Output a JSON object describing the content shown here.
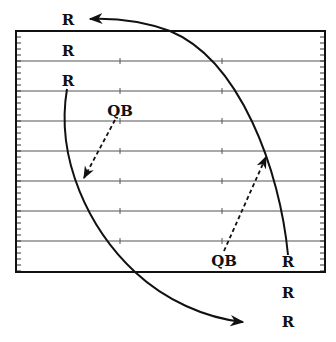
{
  "diagram": {
    "type": "football-play-diagram",
    "field": {
      "left": 16,
      "top": 31,
      "right": 325,
      "bottom": 272,
      "yard_lines_y": [
        61,
        91,
        121,
        151,
        181,
        211,
        241
      ],
      "hash_marks_x": [
        120,
        222
      ],
      "edge_tick_spacing": 6,
      "line_color": "#555555",
      "border_color": "#111111"
    },
    "labels": [
      {
        "id": "receiver-top-1",
        "text": "R",
        "x": 68,
        "y": 20
      },
      {
        "id": "receiver-top-2",
        "text": "R",
        "x": 68,
        "y": 51
      },
      {
        "id": "receiver-top-3",
        "text": "R",
        "x": 68,
        "y": 81
      },
      {
        "id": "quarterback-left",
        "text": "QB",
        "x": 120,
        "y": 111
      },
      {
        "id": "quarterback-right",
        "text": "QB",
        "x": 224,
        "y": 261
      },
      {
        "id": "receiver-bottom-1",
        "text": "R",
        "x": 288,
        "y": 262
      },
      {
        "id": "receiver-bottom-2",
        "text": "R",
        "x": 288,
        "y": 293
      },
      {
        "id": "receiver-bottom-3",
        "text": "R",
        "x": 288,
        "y": 322
      }
    ],
    "routes": [
      {
        "id": "route-right-receiver",
        "path": "M 288 255 C 280 170, 240 60, 170 31 C 145 22, 115 18, 90 19",
        "style": "solid"
      },
      {
        "id": "route-left-receiver",
        "path": "M 67 89 C 55 160, 90 230, 135 272 C 165 300, 205 318, 243 322",
        "style": "solid"
      }
    ],
    "passes": [
      {
        "id": "pass-left",
        "x1": 115,
        "y1": 120,
        "x2": 84,
        "y2": 178,
        "style": "dashed"
      },
      {
        "id": "pass-right",
        "x1": 224,
        "y1": 251,
        "x2": 266,
        "y2": 157,
        "style": "dashed"
      }
    ]
  }
}
